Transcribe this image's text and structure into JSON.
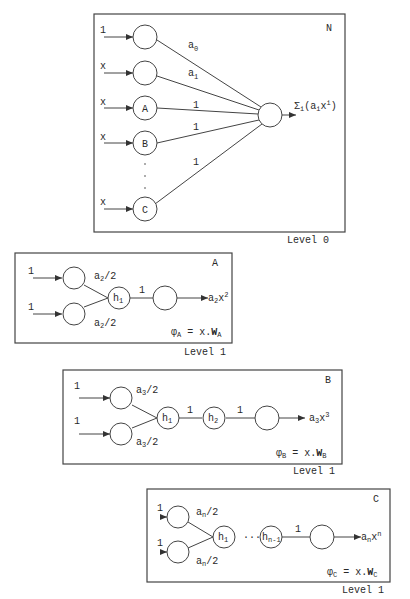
{
  "diagram": {
    "panels": [
      {
        "id": "N",
        "level_label": "Level 0",
        "corner_label": "N",
        "inputs": [
          "1",
          "x",
          "x",
          "x",
          "x"
        ],
        "input_nodes": [
          "",
          "",
          "A",
          "B",
          "C"
        ],
        "ellipsis": "·\n·\n·",
        "weights": [
          "a0",
          "a1",
          "1",
          "1",
          "1"
        ],
        "output_label": "Σi(aixi)"
      },
      {
        "id": "A",
        "level_label": "Level 1",
        "corner_label": "A",
        "inputs": [
          "1",
          "1"
        ],
        "weights_in": [
          "a2/2",
          "a2/2"
        ],
        "hidden": [
          "h1"
        ],
        "weights_hidden": [
          "1"
        ],
        "output_label": "a2x2",
        "phi": "φA = x.WA"
      },
      {
        "id": "B",
        "level_label": "Level 1",
        "corner_label": "B",
        "inputs": [
          "1",
          "1"
        ],
        "weights_in": [
          "a3/2",
          "a3/2"
        ],
        "hidden": [
          "h1",
          "h2"
        ],
        "weights_hidden": [
          "1",
          "1"
        ],
        "output_label": "a3x3",
        "phi": "φB = x.WB"
      },
      {
        "id": "C",
        "level_label": "Level 1",
        "corner_label": "C",
        "inputs": [
          "1",
          "1"
        ],
        "weights_in": [
          "an/2",
          "an/2"
        ],
        "hidden": [
          "h1",
          "hn-1"
        ],
        "hidden_ellipsis": "···",
        "weights_hidden": [
          "1"
        ],
        "output_label": "anxn",
        "phi": "φC = x.WC"
      }
    ]
  },
  "text": {
    "N_corner": "N",
    "N_level": "Level 0",
    "N_in0": "1",
    "N_in1": "x",
    "N_in2": "x",
    "N_in3": "x",
    "N_in4": "x",
    "N_nodeA": "A",
    "N_nodeB": "B",
    "N_nodeC": "C",
    "N_w0": "a",
    "N_w0_sub": "0",
    "N_w1": "a",
    "N_w1_sub": "1",
    "N_w2": "1",
    "N_w3": "1",
    "N_w4": "1",
    "N_out_sigma": "Σ",
    "N_out_sigma_sub": "i",
    "N_out_open": "(a",
    "N_out_a_sub": "i",
    "N_out_x": "x",
    "N_out_x_sup": "i",
    "N_out_close": ")",
    "A_corner": "A",
    "A_level": "Level 1",
    "A_in0": "1",
    "A_in1": "1",
    "A_w": "a",
    "A_w_sub": "2",
    "A_w_tail": "/2",
    "A_h": "h",
    "A_h_sub": "1",
    "A_wh": "1",
    "A_out": "a",
    "A_out_sub": "2",
    "A_out_x": "x",
    "A_out_sup": "2",
    "A_phi": "φ",
    "A_phi_sub": "A",
    "A_phi_mid": " = x.",
    "A_W": "W",
    "A_W_sub": "A",
    "B_corner": "B",
    "B_level": "Level 1",
    "B_in0": "1",
    "B_in1": "1",
    "B_w": "a",
    "B_w_sub": "3",
    "B_w_tail": "/2",
    "B_h1": "h",
    "B_h1_sub": "1",
    "B_h2": "h",
    "B_h2_sub": "2",
    "B_wh1": "1",
    "B_wh2": "1",
    "B_out": "a",
    "B_out_sub": "3",
    "B_out_x": "x",
    "B_out_sup": "3",
    "B_phi": "φ",
    "B_phi_sub": "B",
    "B_phi_mid": " = x.",
    "B_W": "W",
    "B_W_sub": "B",
    "C_corner": "C",
    "C_level": "Level 1",
    "C_in0": "1",
    "C_in1": "1",
    "C_w": "a",
    "C_w_sub": "n",
    "C_w_tail": "/2",
    "C_h1": "h",
    "C_h1_sub": "1",
    "C_dots": "···",
    "C_hn": "h",
    "C_hn_sub": "n-1",
    "C_wh": "1",
    "C_out": "a",
    "C_out_sub": "n",
    "C_out_x": "x",
    "C_out_sup": "n",
    "C_phi": "φ",
    "C_phi_sub": "C",
    "C_phi_mid": " = x.",
    "C_W": "W",
    "C_W_sub": "C"
  },
  "colors": {
    "stroke": "#444444",
    "text": "#2a2a2a",
    "background": "#ffffff"
  }
}
